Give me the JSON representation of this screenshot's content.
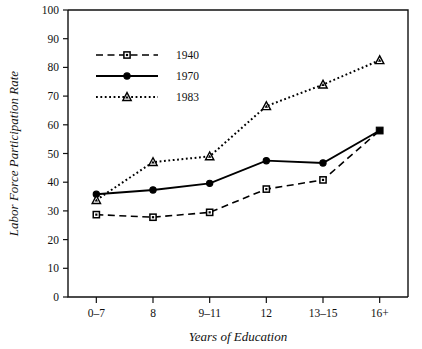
{
  "chart_data": {
    "type": "line",
    "title": "",
    "xlabel": "Years of Education",
    "ylabel": "Labor Force Participation Rate",
    "categories": [
      "0–7",
      "8",
      "9–11",
      "12",
      "13–15",
      "16+"
    ],
    "ylim": [
      0,
      100
    ],
    "yticks": [
      0,
      10,
      20,
      30,
      40,
      50,
      60,
      70,
      80,
      90,
      100
    ],
    "ytick_labels": [
      "0",
      "10",
      "20",
      "30",
      "40",
      "50",
      "60",
      "70",
      "80",
      "90",
      "100"
    ],
    "grid": false,
    "legend_position": "upper-left-inside",
    "series": [
      {
        "name": "1940",
        "values": [
          28.7,
          27.8,
          29.5,
          37.6,
          40.8,
          58.0
        ],
        "line_style": "dashed",
        "marker": "open-square",
        "color": "#000000"
      },
      {
        "name": "1970",
        "values": [
          35.8,
          37.3,
          39.6,
          47.5,
          46.7,
          58.0
        ],
        "line_style": "solid",
        "marker": "filled-circle",
        "color": "#000000"
      },
      {
        "name": "1983",
        "values": [
          33.8,
          47.0,
          49.0,
          66.5,
          74.0,
          82.5
        ],
        "line_style": "dotted",
        "marker": "open-triangle",
        "color": "#000000"
      }
    ]
  },
  "legend": {
    "entries": [
      {
        "label": "1940"
      },
      {
        "label": "1970"
      },
      {
        "label": "1983"
      }
    ]
  }
}
